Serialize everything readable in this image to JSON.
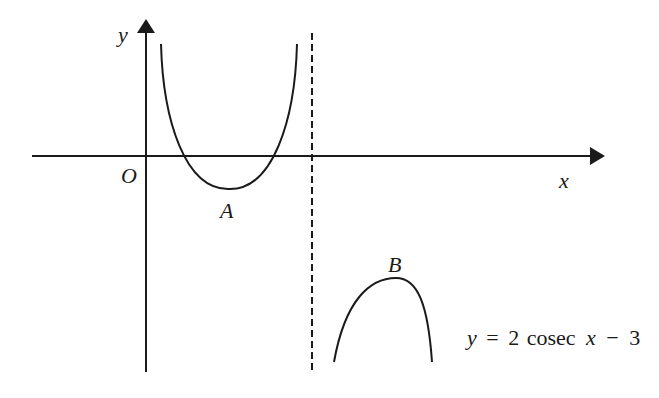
{
  "diagram": {
    "axes": {
      "x_label": "x",
      "y_label": "y",
      "origin_label": "O"
    },
    "points": {
      "A": "A",
      "B": "B"
    },
    "equation": {
      "y": "y",
      "eq_sign": "=",
      "coef": "2",
      "func": "cosec",
      "var": "x",
      "minus": "−",
      "const": "3"
    },
    "asymptote": "dashed vertical line",
    "colors": {
      "stroke": "#1a1a1a",
      "background": "#ffffff"
    }
  }
}
